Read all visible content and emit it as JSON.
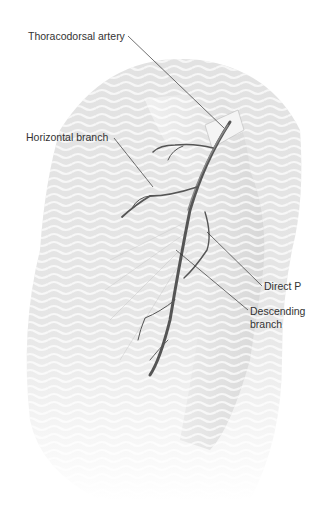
{
  "figure": {
    "colors": {
      "background": "#ffffff",
      "skin_shading": "#d9d9d9",
      "vessel": "#555555",
      "leader_line": "#333333",
      "label_text": "#333333"
    },
    "labels": [
      {
        "id": "thoracodorsal-artery",
        "text": "Thoracodorsal artery"
      },
      {
        "id": "horizontal-branch",
        "text": "Horizontal branch"
      },
      {
        "id": "direct-p",
        "text": "Direct P"
      },
      {
        "id": "descending-branch-line1",
        "text": "Descending"
      },
      {
        "id": "descending-branch-line2",
        "text": "branch"
      }
    ]
  }
}
